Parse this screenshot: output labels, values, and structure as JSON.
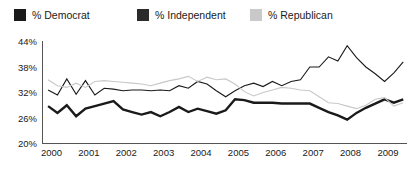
{
  "legend": {
    "position": "top-left",
    "items": [
      {
        "label": "% Democrat",
        "color": "#1a1a1a",
        "swatch": "legend-swatch-democrat"
      },
      {
        "label": "% Independent",
        "color": "#2b2b2b",
        "swatch": "legend-swatch-independent"
      },
      {
        "label": "% Republican",
        "color": "#c9c9c9",
        "swatch": "legend-swatch-republican"
      }
    ]
  },
  "axes": {
    "y_ticks": [
      "44%",
      "38%",
      "32%",
      "26%",
      "20%"
    ],
    "x_ticks": [
      "2000",
      "2001",
      "2002",
      "2003",
      "2004",
      "2005",
      "2006",
      "2007",
      "2008",
      "2009"
    ]
  },
  "chart_data": {
    "type": "line",
    "title": "",
    "xlabel": "",
    "ylabel": "",
    "ylim": [
      20,
      44
    ],
    "xlim": [
      2000,
      2009.75
    ],
    "grid": false,
    "legend_position": "top-left",
    "ytick_values": [
      44,
      38,
      32,
      26,
      20
    ],
    "ytick_labels": [
      "44%",
      "38%",
      "32%",
      "26%",
      "20%"
    ],
    "xtick_values": [
      2000,
      2001,
      2002,
      2003,
      2004,
      2005,
      2006,
      2007,
      2008,
      2009
    ],
    "xtick_labels": [
      "2000",
      "2001",
      "2002",
      "2003",
      "2004",
      "2005",
      "2006",
      "2007",
      "2008",
      "2009"
    ],
    "x": [
      2000.15,
      2000.4,
      2000.65,
      2000.9,
      2001.15,
      2001.4,
      2001.65,
      2001.9,
      2002.15,
      2002.4,
      2002.65,
      2002.9,
      2003.15,
      2003.4,
      2003.65,
      2003.9,
      2004.15,
      2004.4,
      2004.65,
      2004.9,
      2005.15,
      2005.4,
      2005.65,
      2005.9,
      2006.15,
      2006.4,
      2006.65,
      2006.9,
      2007.15,
      2007.4,
      2007.65,
      2007.9,
      2008.15,
      2008.4,
      2008.65,
      2008.9,
      2009.15,
      2009.4,
      2009.65
    ],
    "series": [
      {
        "name": "% Democrat",
        "color": "#1a1a1a",
        "linewidth": 1.1,
        "values": [
          32.6,
          31.4,
          35.2,
          31.6,
          34.8,
          31.4,
          33.0,
          32.8,
          32.4,
          32.6,
          32.6,
          32.4,
          32.6,
          32.4,
          33.6,
          33.0,
          34.6,
          34.0,
          32.4,
          31.0,
          32.4,
          33.6,
          34.2,
          33.4,
          34.6,
          33.6,
          34.6,
          35.0,
          38.0,
          38.0,
          40.4,
          39.4,
          43.0,
          40.2,
          38.0,
          36.4,
          34.6,
          36.6,
          39.2
        ]
      },
      {
        "name": "% Independent",
        "color": "#1a1a1a",
        "linewidth": 2.4,
        "values": [
          28.8,
          27.2,
          29.0,
          26.4,
          28.2,
          28.8,
          29.4,
          30.0,
          28.0,
          27.4,
          26.8,
          27.4,
          26.4,
          27.4,
          28.6,
          27.4,
          28.2,
          27.6,
          27.0,
          27.8,
          30.4,
          30.2,
          29.6,
          29.6,
          29.6,
          29.4,
          29.4,
          29.4,
          29.4,
          28.4,
          27.4,
          26.6,
          25.6,
          27.2,
          28.4,
          29.4,
          30.4,
          29.6,
          30.4
        ]
      },
      {
        "name": "% Republican",
        "color": "#c8c8c8",
        "linewidth": 1.1,
        "values": [
          35.0,
          33.6,
          33.2,
          34.2,
          33.2,
          34.6,
          34.8,
          34.6,
          34.4,
          34.2,
          34.0,
          33.6,
          34.2,
          34.8,
          35.2,
          35.8,
          34.6,
          35.6,
          35.0,
          35.2,
          34.0,
          32.2,
          31.2,
          32.0,
          32.6,
          33.2,
          33.0,
          32.6,
          32.4,
          31.0,
          29.6,
          29.4,
          28.8,
          28.2,
          29.0,
          30.4,
          30.8,
          28.8,
          29.6
        ]
      }
    ]
  }
}
